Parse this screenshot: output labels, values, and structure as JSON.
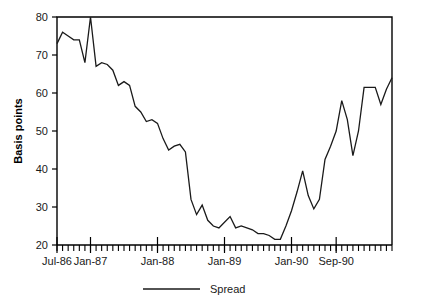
{
  "chart_data": {
    "type": "line",
    "title": "",
    "xlabel": "",
    "ylabel": "Basis points",
    "ylim": [
      20,
      80
    ],
    "yticks": [
      20,
      30,
      40,
      50,
      60,
      70,
      80
    ],
    "grid": false,
    "legend_position": "bottom-center",
    "legend": [
      "Spread"
    ],
    "xtick_labels": [
      "Jul-86",
      "Jan-87",
      "Jan-88",
      "Jan-89",
      "Jan-90",
      "Sep-90"
    ],
    "xtick_indices": [
      0,
      6,
      18,
      30,
      42,
      50
    ],
    "x": [
      "Jul-86",
      "Aug-86",
      "Sep-86",
      "Oct-86",
      "Nov-86",
      "Dec-86",
      "Jan-87",
      "Feb-87",
      "Mar-87",
      "Apr-87",
      "May-87",
      "Jun-87",
      "Jul-87",
      "Aug-87",
      "Sep-87",
      "Oct-87",
      "Nov-87",
      "Dec-87",
      "Jan-88",
      "Feb-88",
      "Mar-88",
      "Apr-88",
      "May-88",
      "Jun-88",
      "Jul-88",
      "Aug-88",
      "Sep-88",
      "Oct-88",
      "Nov-88",
      "Dec-88",
      "Jan-89",
      "Feb-89",
      "Mar-89",
      "Apr-89",
      "May-89",
      "Jun-89",
      "Jul-89",
      "Aug-89",
      "Sep-89",
      "Oct-89",
      "Nov-89",
      "Dec-89",
      "Jan-90",
      "Feb-90",
      "Mar-90",
      "Apr-90",
      "May-90",
      "Jun-90",
      "Jul-90",
      "Aug-90",
      "Sep-90"
    ],
    "series": [
      {
        "name": "Spread",
        "color": "#1a1a1a",
        "values": [
          73,
          76,
          75,
          74,
          74,
          68,
          80,
          67,
          68,
          67.5,
          66,
          62,
          63,
          62,
          56.5,
          55,
          52.5,
          53,
          52,
          48,
          45,
          46,
          46.5,
          44.5,
          32,
          28,
          30.5,
          26.5,
          25,
          24.5,
          26,
          27.5,
          24.5,
          25,
          24.5,
          24,
          23,
          23,
          22.5,
          21.5,
          21.5,
          25,
          29,
          34,
          39.5,
          33,
          29.5,
          32,
          42.5,
          46,
          50
        ]
      }
    ],
    "series_tail": {
      "note": "extended monthly values continue to Sep-90",
      "values": [
        58,
        53,
        43.5,
        50,
        61.5,
        61.5,
        61.5,
        57,
        61,
        64
      ]
    }
  },
  "axis": {
    "y_axis_title": "Basis points"
  },
  "legend": {
    "entries": [
      {
        "label": "Spread",
        "color": "#1a1a1a"
      }
    ]
  }
}
